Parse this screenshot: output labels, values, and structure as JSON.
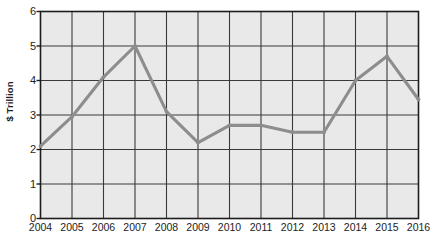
{
  "chart_data": {
    "type": "line",
    "title": "",
    "xlabel": "",
    "ylabel": "$ Trillion",
    "categories": [
      "2004",
      "2005",
      "2006",
      "2007",
      "2008",
      "2009",
      "2010",
      "2011",
      "2012",
      "2013",
      "2014",
      "2015",
      "2016"
    ],
    "values": [
      2.1,
      2.95,
      4.1,
      5.0,
      3.1,
      2.2,
      2.7,
      2.7,
      2.5,
      2.5,
      4.0,
      4.7,
      3.45
    ],
    "series": [
      {
        "name": "$ Trillion",
        "values": [
          2.1,
          2.95,
          4.1,
          5.0,
          3.1,
          2.2,
          2.7,
          2.7,
          2.5,
          2.5,
          4.0,
          4.7,
          3.45
        ]
      }
    ],
    "ylim": [
      0,
      6
    ],
    "y_ticks": [
      "0",
      "1",
      "2",
      "3",
      "4",
      "5",
      "6"
    ],
    "x_ticks": [
      "2004",
      "2005",
      "2006",
      "2007",
      "2008",
      "2009",
      "2010",
      "2011",
      "2012",
      "2013",
      "2014",
      "2015",
      "2016"
    ],
    "grid": true,
    "legend": "none",
    "colors": {
      "line": "#8d8d8d",
      "plot_background": "#e9e9e9",
      "gridline": "#3a3a3a",
      "axis": "#1d1d1d",
      "page_background": "#ffffff"
    }
  }
}
